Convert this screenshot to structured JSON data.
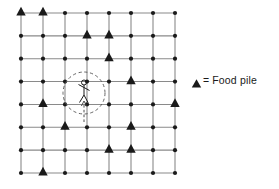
{
  "figure": {
    "title": "",
    "grid": {
      "rows": 8,
      "cols": 8,
      "x_start": 21,
      "y_start": 13,
      "x_step": 22,
      "y_step": 22.857,
      "line_color": "#8a8a8a",
      "node_color": "#1a1a1a",
      "node_radius": 2.1
    },
    "food_piles": {
      "label": "Food pile",
      "marker": "triangle",
      "color": "#1a1a1a",
      "positions": [
        {
          "row": 1,
          "col": 1
        },
        {
          "row": 1,
          "col": 2
        },
        {
          "row": 2,
          "col": 4
        },
        {
          "row": 2,
          "col": 5
        },
        {
          "row": 3,
          "col": 5
        },
        {
          "row": 4,
          "col": 6
        },
        {
          "row": 5,
          "col": 2
        },
        {
          "row": 5,
          "col": 8
        },
        {
          "row": 6,
          "col": 3
        },
        {
          "row": 6,
          "col": 6
        },
        {
          "row": 7,
          "col": 5
        },
        {
          "row": 7,
          "col": 6
        },
        {
          "row": 8,
          "col": 2
        }
      ]
    },
    "agent": {
      "name": "forager",
      "type": "stick-figure",
      "x": 84,
      "y": 93,
      "color": "#1a1a1a"
    },
    "perception_circle": {
      "center_x": 84,
      "center_y": 93,
      "radius": 21,
      "style": "dashed",
      "color": "#555555"
    },
    "approach_arrow": {
      "x": 84,
      "y_from": 122,
      "y_to": 101,
      "style": "dashed",
      "direction": "up",
      "color": "#3a3a3a"
    }
  },
  "legend": {
    "marker_glyph": "triangle-icon",
    "equals": "=",
    "label": "Food  pile"
  }
}
